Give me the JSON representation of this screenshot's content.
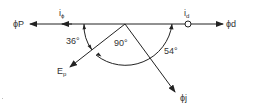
{
  "diagram": {
    "type": "phasor-diagram",
    "colors": {
      "line": "#222222",
      "text": "#333333",
      "background": "#ffffff"
    },
    "labels": {
      "phi_p": "ϕP",
      "i_phi_main": "i",
      "i_phi_sub": "ϕ",
      "i_d_main": "i",
      "i_d_sub": "d",
      "phi_d": "ϕd",
      "e_p_main": "E",
      "e_p_sub": "p",
      "phi_j": "ϕj",
      "angle_36": "36°",
      "angle_90": "90°",
      "angle_54": "54°"
    },
    "vectors": [
      {
        "name": "phi-p",
        "direction": "left",
        "label": "ϕP"
      },
      {
        "name": "phi-d",
        "direction": "right",
        "label": "ϕd"
      },
      {
        "name": "e-p",
        "direction": "down-left",
        "label": "Ep"
      },
      {
        "name": "phi-j",
        "direction": "down-right",
        "label": "ϕj"
      }
    ],
    "angles": [
      {
        "between": [
          "ϕP",
          "Ep"
        ],
        "value": "36°"
      },
      {
        "between": [
          "Ep",
          "ϕj"
        ],
        "value": "90°"
      },
      {
        "between": [
          "ϕj",
          "ϕd"
        ],
        "value": "54°"
      }
    ]
  }
}
